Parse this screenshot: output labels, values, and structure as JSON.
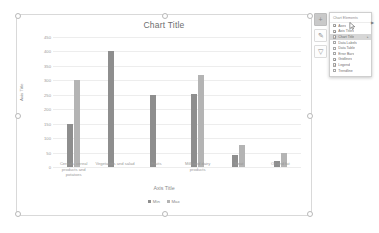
{
  "chart_data": {
    "type": "bar",
    "title": "Chart Title",
    "xlabel": "Axis Title",
    "ylabel": "Axis Title",
    "ylim": [
      0,
      450
    ],
    "grid": true,
    "legend_position": "bottom",
    "categories": [
      "Cereals, cereal products and potatoes",
      "Vegetables and salad",
      "Fruits",
      "Milk and dairy products",
      "Meat",
      "Oil and fat"
    ],
    "yticks": [
      "450",
      "400",
      "350",
      "300",
      "250",
      "200",
      "150",
      "100",
      "50",
      "0"
    ],
    "series": [
      {
        "name": "Min",
        "color": "#8e8e8e",
        "values": [
          150,
          400,
          250,
          252,
          40,
          22
        ]
      },
      {
        "name": "Max",
        "color": "#b4b4b4",
        "values": [
          300,
          0,
          0,
          320,
          75,
          48
        ]
      }
    ]
  },
  "side_buttons": [
    {
      "name": "chart-elements",
      "glyph": "+",
      "active": true
    },
    {
      "name": "chart-styles",
      "glyph": "✎",
      "active": false
    },
    {
      "name": "chart-filters",
      "glyph": "▽",
      "active": false
    }
  ],
  "elements_panel": {
    "heading": "Chart Elements",
    "items": [
      {
        "label": "Axes",
        "checked": true,
        "arrow": false
      },
      {
        "label": "Axis Titles",
        "checked": true,
        "arrow": false
      },
      {
        "label": "Chart Title",
        "checked": true,
        "arrow": true,
        "selected": true
      },
      {
        "label": "Data Labels",
        "checked": false,
        "arrow": false
      },
      {
        "label": "Data Table",
        "checked": false,
        "arrow": false
      },
      {
        "label": "Error Bars",
        "checked": false,
        "arrow": false
      },
      {
        "label": "Gridlines",
        "checked": true,
        "arrow": false
      },
      {
        "label": "Legend",
        "checked": true,
        "arrow": false
      },
      {
        "label": "Trendline",
        "checked": false,
        "arrow": false
      }
    ],
    "submenu_caret": "▶"
  }
}
